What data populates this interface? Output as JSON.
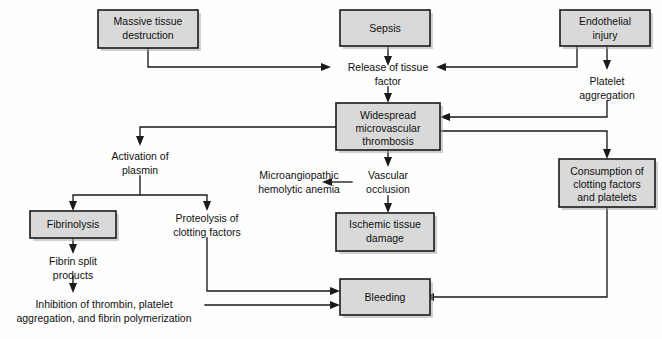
{
  "diagram": {
    "colors": {
      "box_fill": "#d9d9d9",
      "box_border": "#1a1a1a",
      "connector": "#1a1a1a",
      "background": "#fefefe",
      "text": "#101010"
    },
    "nodes": {
      "massive_tissue_destruction": {
        "line1": "Massive tissue",
        "line2": "destruction",
        "type": "box"
      },
      "sepsis": {
        "line1": "Sepsis",
        "type": "box"
      },
      "endothelial_injury": {
        "line1": "Endothelial",
        "line2": "injury",
        "type": "box"
      },
      "release_of_tissue_factor": {
        "line1": "Release of tissue",
        "line2": "factor",
        "type": "text"
      },
      "platelet_aggregation": {
        "line1": "Platelet",
        "line2": "aggregation",
        "type": "text"
      },
      "widespread_microvascular_thrombosis": {
        "line1": "Widespread",
        "line2": "microvascular",
        "line3": "thrombosis",
        "type": "box"
      },
      "activation_of_plasmin": {
        "line1": "Activation of",
        "line2": "plasmin",
        "type": "text"
      },
      "microangiopathic_hemolytic_anemia": {
        "line1": "Microangiopathic",
        "line2": "hemolytic anemia",
        "type": "text"
      },
      "vascular_occlusion": {
        "line1": "Vascular",
        "line2": "occlusion",
        "type": "text"
      },
      "consumption_of_clotting_factors": {
        "line1": "Consumption of",
        "line2": "clotting factors",
        "line3": "and platelets",
        "type": "box"
      },
      "fibrinolysis": {
        "line1": "Fibrinolysis",
        "type": "box"
      },
      "proteolysis_of_clotting_factors": {
        "line1": "Proteolysis of",
        "line2": "clotting factors",
        "type": "text"
      },
      "ischemic_tissue_damage": {
        "line1": "Ischemic tissue",
        "line2": "damage",
        "type": "box"
      },
      "fibrin_split_products": {
        "line1": "Fibrin split",
        "line2": "products",
        "type": "text"
      },
      "inhibition_of_thrombin": {
        "line1": "Inhibition of thrombin, platelet",
        "line2": "aggregation, and fibrin polymerization",
        "type": "text"
      },
      "bleeding": {
        "line1": "Bleeding",
        "type": "box"
      }
    },
    "edges": [
      {
        "from": "massive_tissue_destruction",
        "to": "release_of_tissue_factor"
      },
      {
        "from": "sepsis",
        "to": "release_of_tissue_factor"
      },
      {
        "from": "endothelial_injury",
        "to": "release_of_tissue_factor"
      },
      {
        "from": "endothelial_injury",
        "to": "platelet_aggregation"
      },
      {
        "from": "release_of_tissue_factor",
        "to": "widespread_microvascular_thrombosis"
      },
      {
        "from": "platelet_aggregation",
        "to": "widespread_microvascular_thrombosis"
      },
      {
        "from": "widespread_microvascular_thrombosis",
        "to": "activation_of_plasmin"
      },
      {
        "from": "widespread_microvascular_thrombosis",
        "to": "vascular_occlusion"
      },
      {
        "from": "widespread_microvascular_thrombosis",
        "to": "consumption_of_clotting_factors"
      },
      {
        "from": "activation_of_plasmin",
        "to": "fibrinolysis"
      },
      {
        "from": "activation_of_plasmin",
        "to": "proteolysis_of_clotting_factors"
      },
      {
        "from": "vascular_occlusion",
        "to": "microangiopathic_hemolytic_anemia"
      },
      {
        "from": "vascular_occlusion",
        "to": "ischemic_tissue_damage"
      },
      {
        "from": "fibrinolysis",
        "to": "fibrin_split_products"
      },
      {
        "from": "fibrin_split_products",
        "to": "inhibition_of_thrombin"
      },
      {
        "from": "proteolysis_of_clotting_factors",
        "to": "bleeding"
      },
      {
        "from": "inhibition_of_thrombin",
        "to": "bleeding"
      },
      {
        "from": "consumption_of_clotting_factors",
        "to": "bleeding"
      }
    ]
  }
}
